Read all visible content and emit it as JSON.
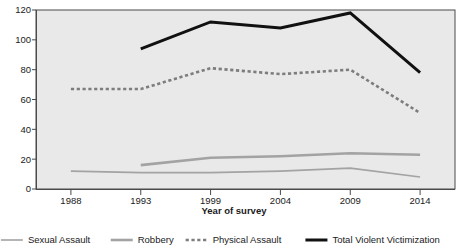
{
  "chart_data": {
    "type": "line",
    "title": "",
    "xlabel": "Year of survey",
    "ylabel": "",
    "categories": [
      "1988",
      "1993",
      "1999",
      "2004",
      "2009",
      "2014"
    ],
    "x": [
      1988,
      1993,
      1999,
      2004,
      2009,
      2014
    ],
    "ylim": [
      0,
      120
    ],
    "yticks": [
      0,
      20,
      40,
      60,
      80,
      100,
      120
    ],
    "grid": false,
    "legend_position": "bottom",
    "series": [
      {
        "name": "Sexual Assault",
        "style": "solid-thin",
        "color": "#a3a3a3",
        "values": [
          12,
          11,
          11,
          12,
          14,
          8
        ]
      },
      {
        "name": "Robbery",
        "style": "solid-medium",
        "color": "#a3a3a3",
        "values": [
          null,
          16,
          21,
          22,
          24,
          23
        ]
      },
      {
        "name": "Physical Assault",
        "style": "dashed",
        "color": "#7d7d7d",
        "values": [
          67,
          67,
          81,
          77,
          80,
          51
        ]
      },
      {
        "name": "Total Violent Victimization",
        "style": "solid-thick",
        "color": "#111111",
        "values": [
          null,
          94,
          112,
          108,
          118,
          78
        ]
      }
    ]
  },
  "axis": {
    "ytick_labels": [
      "0",
      "20",
      "40",
      "60",
      "80",
      "100",
      "120"
    ],
    "xtick_labels": [
      "1988",
      "1993",
      "1999",
      "2004",
      "2009",
      "2014"
    ],
    "x_title": "Year of survey"
  },
  "legend": {
    "items": [
      {
        "label": "Sexual Assault",
        "color": "#a3a3a3",
        "style": "solid-thin"
      },
      {
        "label": "Robbery",
        "color": "#a3a3a3",
        "style": "solid-medium"
      },
      {
        "label": "Physical Assault",
        "color": "#7d7d7d",
        "style": "dashed"
      },
      {
        "label": "Total Violent Victimization",
        "color": "#111111",
        "style": "solid-thick"
      }
    ]
  },
  "colors": {
    "plot_background": "#e9e9e9",
    "axis": "#4a4a4a",
    "text": "#1a1a1a",
    "page_background": "#ffffff"
  }
}
